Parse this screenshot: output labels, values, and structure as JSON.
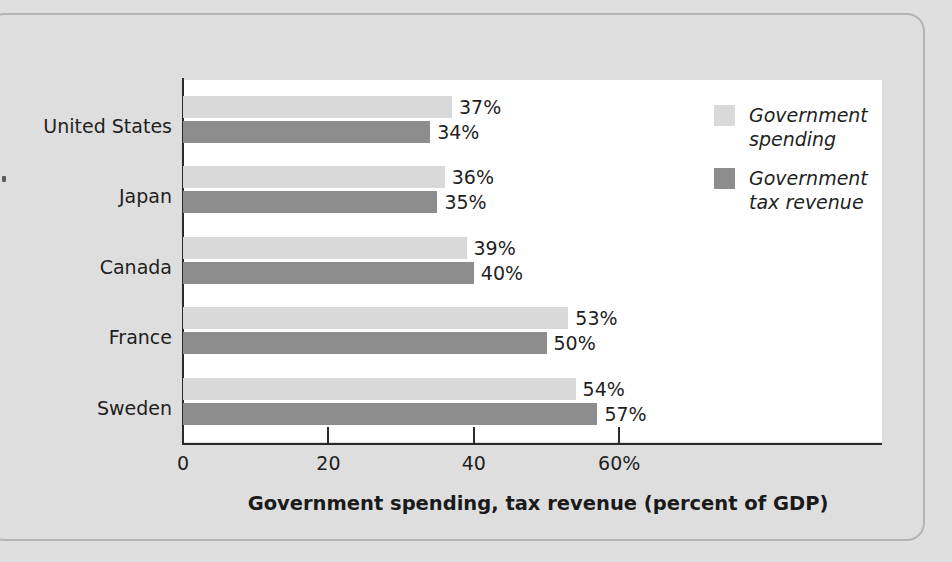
{
  "chart_data": {
    "type": "bar",
    "orientation": "horizontal",
    "title": "",
    "xlabel": "Government spending, tax revenue (percent of GDP)",
    "ylabel": "",
    "xlim": [
      0,
      65
    ],
    "grid": false,
    "legend_position": "top-right",
    "categories": [
      "United States",
      "Japan",
      "Canada",
      "France",
      "Sweden"
    ],
    "series": [
      {
        "name": "Government spending",
        "color": "#d9d9d9",
        "values": [
          37,
          36,
          39,
          53,
          54
        ],
        "labels": [
          "37%",
          "36%",
          "39%",
          "53%",
          "54%"
        ]
      },
      {
        "name": "Government tax revenue",
        "color": "#8d8d8d",
        "values": [
          34,
          35,
          40,
          50,
          57
        ],
        "labels": [
          "34%",
          "35%",
          "40%",
          "50%",
          "57%"
        ]
      }
    ],
    "xticks": [
      0,
      20,
      40,
      60
    ],
    "xtick_labels": [
      "0",
      "20",
      "40",
      "60%"
    ]
  },
  "legend": {
    "entries": [
      {
        "label": "Government\nspending"
      },
      {
        "label": "Government\ntax revenue"
      }
    ]
  },
  "colors": {
    "background": "#dedede",
    "plot_background": "#ffffff",
    "axis": "#2a2a2a",
    "spending": "#d9d9d9",
    "tax_revenue": "#8d8d8d",
    "text": "#1f1f1f"
  }
}
